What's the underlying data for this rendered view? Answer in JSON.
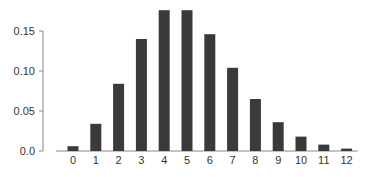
{
  "chart_data": {
    "type": "bar",
    "title": "",
    "xlabel": "",
    "ylabel": "",
    "categories": [
      "0",
      "1",
      "2",
      "3",
      "4",
      "5",
      "6",
      "7",
      "8",
      "9",
      "10",
      "11",
      "12"
    ],
    "values": [
      0.006,
      0.034,
      0.084,
      0.14,
      0.176,
      0.176,
      0.146,
      0.104,
      0.065,
      0.036,
      0.018,
      0.008,
      0.003
    ],
    "ylim": [
      0,
      0.18
    ],
    "yticks": [
      0.0,
      0.05,
      0.1,
      0.15
    ],
    "ytick_labels": [
      "0.0",
      "0.05",
      "0.10",
      "0.15"
    ],
    "grid": false,
    "legend": null,
    "bar_color": "#3a3a3a",
    "axis_color": "#888888"
  }
}
